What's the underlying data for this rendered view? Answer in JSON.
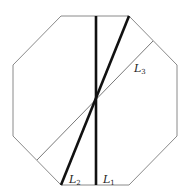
{
  "diagram": {
    "shape": "regular octagon",
    "stroke_color": "#8a8a8a",
    "line_color": "#111111",
    "octagon_points": [
      [
        61,
        16
      ],
      [
        129,
        16
      ],
      [
        177,
        65
      ],
      [
        177,
        136
      ],
      [
        129,
        185
      ],
      [
        61,
        185
      ],
      [
        13,
        136
      ],
      [
        13,
        65
      ]
    ],
    "lines": [
      {
        "name": "L1",
        "base": "L",
        "sub": "1",
        "x1": 96,
        "y1": 16,
        "x2": 96,
        "y2": 185,
        "weight": "thick",
        "label_pos": [
          103,
          183
        ]
      },
      {
        "name": "L2",
        "base": "L",
        "sub": "2",
        "x1": 129,
        "y1": 16,
        "x2": 61,
        "y2": 185,
        "weight": "thick",
        "label_pos": [
          69,
          183
        ]
      },
      {
        "name": "L3",
        "base": "L",
        "sub": "3",
        "x1": 153,
        "y1": 41,
        "x2": 37,
        "y2": 160,
        "weight": "thin",
        "label_pos": [
          134,
          72
        ]
      }
    ],
    "intersection": [
      96,
      97
    ]
  }
}
